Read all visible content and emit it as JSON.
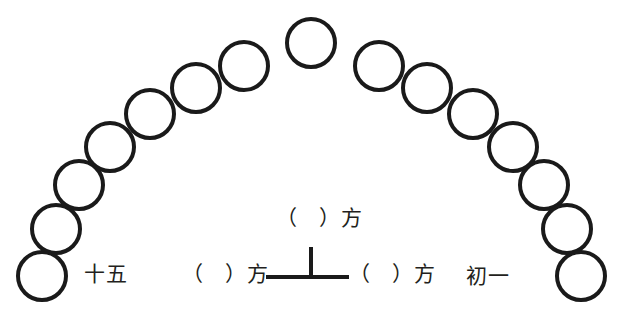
{
  "figure": {
    "title": "",
    "background_color": "#ffffff",
    "stroke_color": "#1a1a1a",
    "text_color": "#231f20",
    "width": 623,
    "height": 331
  },
  "arc": {
    "description": "moon-phase circles arranged in an arch",
    "circle_count": 15,
    "circle_radius": 24,
    "stroke_width": 4,
    "fill": "none",
    "centers": [
      {
        "cx": 42,
        "cy": 276
      },
      {
        "cx": 56,
        "cy": 229
      },
      {
        "cx": 79,
        "cy": 185
      },
      {
        "cx": 110,
        "cy": 147
      },
      {
        "cx": 150,
        "cy": 114
      },
      {
        "cx": 196,
        "cy": 88
      },
      {
        "cx": 244,
        "cy": 66
      },
      {
        "cx": 311,
        "cy": 43
      },
      {
        "cx": 379,
        "cy": 66
      },
      {
        "cx": 427,
        "cy": 88
      },
      {
        "cx": 473,
        "cy": 114
      },
      {
        "cx": 513,
        "cy": 147
      },
      {
        "cx": 544,
        "cy": 185
      },
      {
        "cx": 567,
        "cy": 229
      },
      {
        "cx": 581,
        "cy": 276
      }
    ]
  },
  "axis_marker": {
    "name": "perpendicular-axis-mark",
    "glyph": "⊥",
    "horizontal": {
      "x1": 266,
      "y1": 277,
      "x2": 349,
      "y2": 277
    },
    "vertical": {
      "x1": 311,
      "y1": 247,
      "x2": 311,
      "y2": 277
    },
    "stroke_width": 4
  },
  "labels": {
    "left_end": "十五",
    "right_end": "初一",
    "direction_top": "（　）方",
    "direction_left": "（　）方",
    "direction_right": "（　）方"
  }
}
